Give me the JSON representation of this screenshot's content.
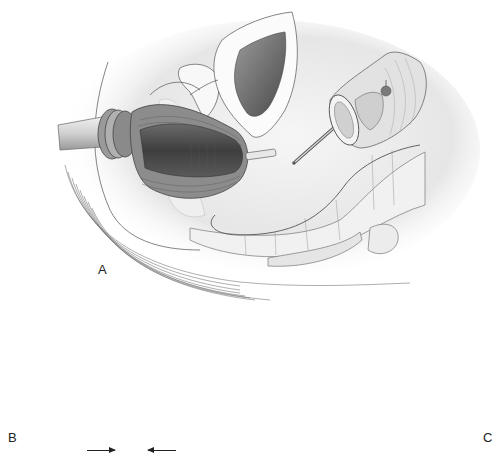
{
  "figure": {
    "panels": [
      {
        "id": "A",
        "label": "A",
        "description": "Sagittal pelvic view: circular stapler inserted transanally into rectal stump; anvil placed in proximal colon"
      },
      {
        "id": "B",
        "label": "B",
        "description": "Stapler shaft and anvil approximated; arrows indicate closure"
      },
      {
        "id": "C",
        "label": "C",
        "description": "Completed end-to-end anastomosis of colon"
      }
    ],
    "arrows": [
      {
        "panel": "B",
        "direction": "right"
      },
      {
        "panel": "B",
        "direction": "left"
      }
    ],
    "parts": [
      "circular-stapler",
      "stapler-shaft",
      "anvil",
      "rectal-stump",
      "proximal-colon",
      "bladder",
      "sacrum",
      "uterus"
    ],
    "colors": {
      "line": "#555555",
      "dark_tissue": "#4a4a4a",
      "mid_tissue": "#8a8a8a",
      "light_tissue": "#d9d9d9",
      "background": "#ffffff"
    }
  }
}
